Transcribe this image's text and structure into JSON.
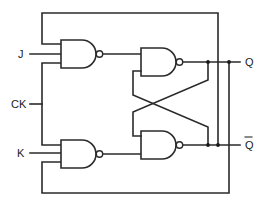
{
  "diagram": {
    "labels": {
      "j": "J",
      "ck": "CK",
      "k": "K",
      "q": "Q",
      "q_bar": "Q"
    },
    "colors": {
      "line": "#2a2a2a",
      "background": "#ffffff"
    },
    "components": [
      {
        "id": "nand-j",
        "type": "NAND",
        "inputs": [
          "Q̄ feedback",
          "J",
          "CK"
        ],
        "output": "to nand-top"
      },
      {
        "id": "nand-k",
        "type": "NAND",
        "inputs": [
          "CK",
          "K",
          "Q feedback"
        ],
        "output": "to nand-bottom"
      },
      {
        "id": "nand-top",
        "type": "NAND",
        "inputs": [
          "nand-j",
          "Q̄ (cross-coupled)"
        ],
        "output": "Q"
      },
      {
        "id": "nand-bottom",
        "type": "NAND",
        "inputs": [
          "Q (cross-coupled)",
          "nand-k"
        ],
        "output": "Q̄"
      }
    ]
  }
}
